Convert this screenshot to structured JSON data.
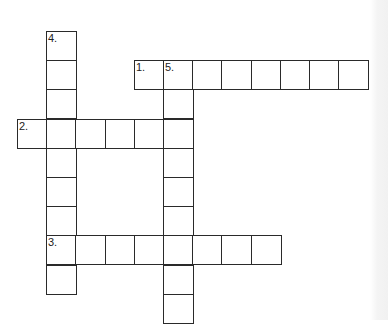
{
  "puzzle": {
    "type": "crossword",
    "cell_size": 29.2,
    "origin": {
      "x": 17,
      "y": 31
    },
    "clues": {
      "across": [
        {
          "number": "1.",
          "row": 1,
          "col": 4,
          "length": 8
        },
        {
          "number": "2.",
          "row": 3,
          "col": 0,
          "length": 6
        },
        {
          "number": "3.",
          "row": 7,
          "col": 1,
          "length": 8
        }
      ],
      "down": [
        {
          "number": "4.",
          "row": 0,
          "col": 1,
          "length": 9
        },
        {
          "number": "5.",
          "row": 1,
          "col": 5,
          "length": 9
        }
      ]
    }
  },
  "colors": {
    "line": "#2a2a2a",
    "background": "#ffffff"
  }
}
